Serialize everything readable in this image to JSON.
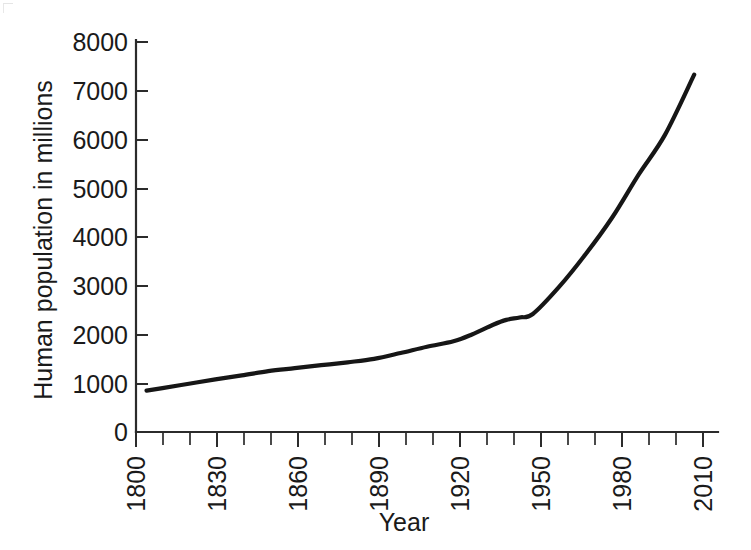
{
  "chart_data": {
    "type": "line",
    "title": "",
    "subtitle": "",
    "xlabel": "Year",
    "ylabel": "Human population in millions",
    "xlim": [
      1800,
      2020
    ],
    "ylim": [
      0,
      8000
    ],
    "grid": false,
    "legend": null,
    "x_ticks": [
      1800,
      1830,
      1860,
      1890,
      1920,
      1950,
      1980,
      2010
    ],
    "x_tick_labels": [
      "1800",
      "1830",
      "1860",
      "1890",
      "1920",
      "1950",
      "1980",
      "2010"
    ],
    "x_minor_tick_step": 10,
    "y_ticks": [
      0,
      1000,
      2000,
      3000,
      4000,
      5000,
      6000,
      7000,
      8000
    ],
    "y_tick_labels": [
      "0",
      "1000",
      "2000",
      "3000",
      "4000",
      "5000",
      "6000",
      "7000",
      "8000"
    ],
    "line_color": "#161616",
    "x": [
      1804,
      1810,
      1820,
      1830,
      1840,
      1850,
      1860,
      1870,
      1880,
      1890,
      1900,
      1910,
      1920,
      1927,
      1935,
      1940,
      1945,
      1950,
      1960,
      1970,
      1980,
      1990,
      2000,
      2011
    ],
    "values": [
      850,
      900,
      990,
      1080,
      1160,
      1250,
      1310,
      1370,
      1430,
      1500,
      1620,
      1750,
      1860,
      2000,
      2200,
      2300,
      2350,
      2420,
      2980,
      3650,
      4400,
      5280,
      6100,
      7330
    ],
    "series": [
      {
        "name": "Human population",
        "x": [
          1804,
          1810,
          1820,
          1830,
          1840,
          1850,
          1860,
          1870,
          1880,
          1890,
          1900,
          1910,
          1920,
          1927,
          1935,
          1940,
          1945,
          1950,
          1960,
          1970,
          1980,
          1990,
          2000,
          2011
        ],
        "values": [
          850,
          900,
          990,
          1080,
          1160,
          1250,
          1310,
          1370,
          1430,
          1500,
          1620,
          1750,
          1860,
          2000,
          2200,
          2300,
          2350,
          2420,
          2980,
          3650,
          4400,
          5280,
          6100,
          7330
        ]
      }
    ]
  },
  "axes": {
    "y_title": "Human population in millions",
    "x_title": "Year"
  }
}
